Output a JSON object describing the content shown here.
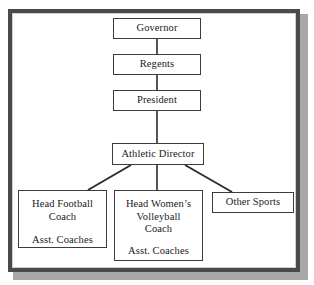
{
  "diagram": {
    "frame_color": "#4a4a4a",
    "shadow_color": "#a8a8a8",
    "box_border_color": "#3c3c3c",
    "connector_color": "#2b2b2b",
    "background": "#ffffff"
  },
  "nodes": {
    "governor": {
      "label": "Governor"
    },
    "regents": {
      "label": "Regents"
    },
    "president": {
      "label": "President"
    },
    "athletic_director": {
      "label": "Athletic Director"
    },
    "head_football_coach": {
      "line1": "Head Football",
      "line2": "Coach",
      "sub": "Asst. Coaches"
    },
    "head_womens_volleyball_coach": {
      "line1": "Head Women’s",
      "line2": "Volleyball",
      "line3": "Coach",
      "sub": "Asst. Coaches"
    },
    "other_sports": {
      "label": "Other Sports"
    }
  },
  "edges": [
    {
      "from": "governor",
      "to": "regents",
      "style": "vertical"
    },
    {
      "from": "regents",
      "to": "president",
      "style": "vertical"
    },
    {
      "from": "president",
      "to": "athletic_director",
      "style": "vertical"
    },
    {
      "from": "athletic_director",
      "to": "head_football_coach",
      "style": "diagonal-left"
    },
    {
      "from": "athletic_director",
      "to": "head_womens_volleyball_coach",
      "style": "vertical"
    },
    {
      "from": "athletic_director",
      "to": "other_sports",
      "style": "diagonal-right"
    }
  ]
}
